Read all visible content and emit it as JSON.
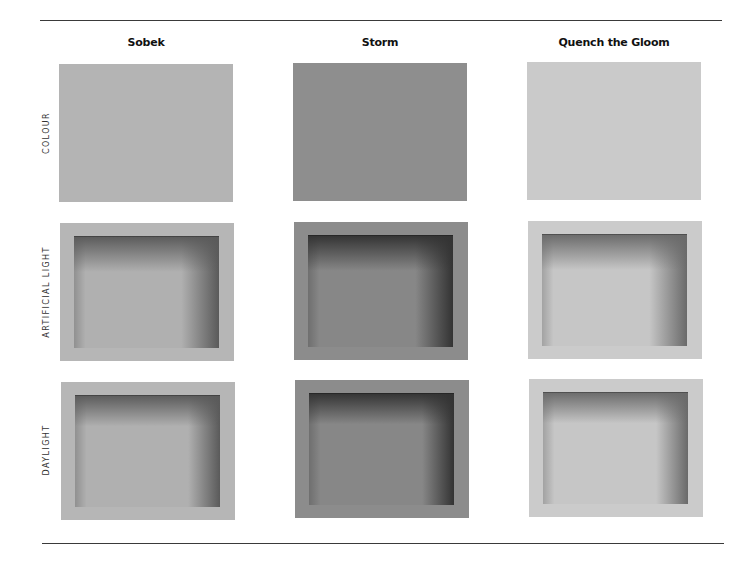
{
  "columns": [
    {
      "name": "Sobek",
      "colour": "#b4b4b4",
      "frame": "#b6b6b6",
      "inner_light": "#b0b0b0",
      "inner_dark": "#5a5a5a"
    },
    {
      "name": "Storm",
      "colour": "#8e8e8e",
      "frame": "#8c8c8c",
      "inner_light": "#878787",
      "inner_dark": "#333333"
    },
    {
      "name": "Quench the Gloom",
      "colour": "#cacaca",
      "frame": "#cbcbcb",
      "inner_light": "#c6c6c6",
      "inner_dark": "#6a6a6a"
    }
  ],
  "rows": [
    {
      "label": "COLOUR"
    },
    {
      "label": "ARTIFICIAL LIGHT"
    },
    {
      "label": "DAYLIGHT"
    }
  ]
}
